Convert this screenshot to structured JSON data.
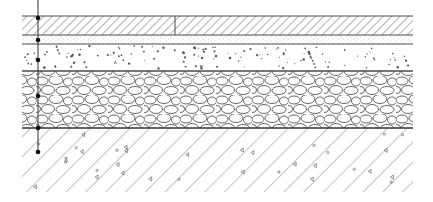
{
  "diagram": {
    "type": "pavement-cross-section",
    "colors": {
      "line": "#4a4a4a",
      "hatch": "#7a7a7a",
      "background": "#ffffff",
      "marker": "#111111"
    },
    "extent": {
      "x0": 22,
      "x1": 413
    },
    "layers": [
      {
        "name": "surface-slab",
        "pattern": "diagonal-hatch",
        "y0": 16,
        "y1": 35,
        "joint_x": 175
      },
      {
        "name": "fine-sand-bedding",
        "pattern": "fine-stipple",
        "y0": 35,
        "y1": 44
      },
      {
        "name": "sand-base",
        "pattern": "sparse-dots",
        "y0": 44,
        "y1": 71
      },
      {
        "name": "gravel-subbase",
        "pattern": "cobbles",
        "y0": 71,
        "y1": 128
      },
      {
        "name": "natural-soil",
        "pattern": "soil-hatch",
        "y0": 128,
        "y1": 192
      }
    ],
    "dimension_line": {
      "x": 38,
      "y_top": 0,
      "y_bottom": 152,
      "markers_y": [
        18,
        40,
        60,
        96,
        128,
        152
      ]
    }
  }
}
